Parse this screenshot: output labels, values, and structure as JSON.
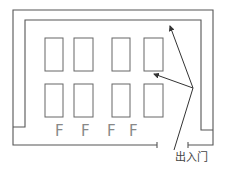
{
  "diagram": {
    "title": "",
    "stalls": {
      "rows": 2,
      "columns": 4,
      "top_row": [
        {
          "x": 45,
          "y": 38,
          "w": 18,
          "h": 33
        },
        {
          "x": 74,
          "y": 38,
          "w": 19,
          "h": 33
        },
        {
          "x": 112,
          "y": 38,
          "w": 18,
          "h": 33
        },
        {
          "x": 144,
          "y": 38,
          "w": 19,
          "h": 33
        }
      ],
      "bottom_row": [
        {
          "x": 45,
          "y": 84,
          "w": 18,
          "h": 33
        },
        {
          "x": 74,
          "y": 84,
          "w": 19,
          "h": 33
        },
        {
          "x": 112,
          "y": 84,
          "w": 18,
          "h": 33
        },
        {
          "x": 144,
          "y": 84,
          "w": 19,
          "h": 33
        }
      ]
    },
    "f_labels": [
      {
        "text": "F",
        "x": 55,
        "y": 136
      },
      {
        "text": "F",
        "x": 81,
        "y": 136
      },
      {
        "text": "F",
        "x": 107,
        "y": 136
      },
      {
        "text": "F",
        "x": 129,
        "y": 136
      }
    ],
    "door_label": "出入门",
    "colors": {
      "wall": "#555555",
      "stall": "#666666",
      "arrow": "#333333",
      "f_label": "#888888",
      "text": "#444444"
    }
  }
}
